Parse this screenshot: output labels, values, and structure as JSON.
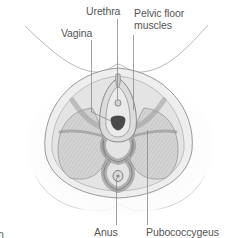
{
  "diagram": {
    "labels": {
      "urethra": "Urethra",
      "vagina": "Vagina",
      "pelvic_floor_line1": "Pelvic floor",
      "pelvic_floor_line2": "muscles",
      "anus": "Anus",
      "pubococcygeus": "Pubococcygeus",
      "cropped_caption_char": "n"
    },
    "colors": {
      "label_text": "#555555",
      "leader_line": "#8a8a8a",
      "outline": "#9a9a9a",
      "muscle_fill": "#cfcfcf",
      "shadow_fill": "#e6e6e6",
      "background": "#ffffff"
    }
  }
}
